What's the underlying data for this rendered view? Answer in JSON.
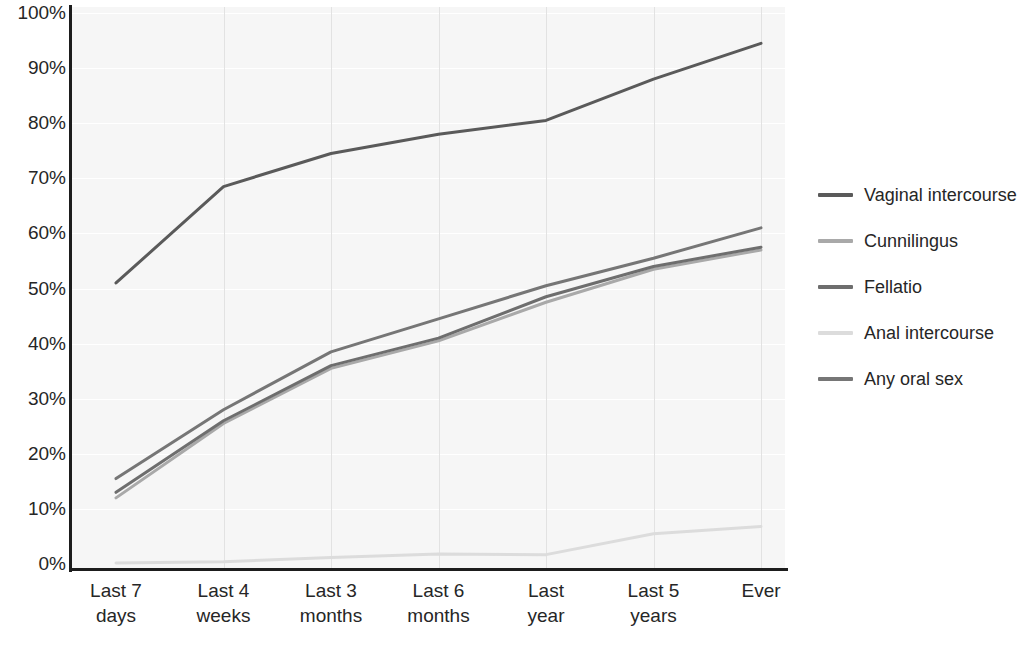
{
  "chart_data": {
    "type": "line",
    "title": "",
    "xlabel": "",
    "ylabel": "",
    "ylim": [
      0,
      100
    ],
    "ytick_labels": [
      "0%",
      "10%",
      "20%",
      "30%",
      "40%",
      "50%",
      "60%",
      "70%",
      "80%",
      "90%",
      "100%"
    ],
    "ytick_values": [
      0,
      10,
      20,
      30,
      40,
      50,
      60,
      70,
      80,
      90,
      100
    ],
    "grid": "horizontal-white-and-vertical-gray",
    "legend_position": "right",
    "categories": [
      "Last 7 days",
      "Last 4 weeks",
      "Last 3 months",
      "Last 6 months",
      "Last year",
      "Last 5 years",
      "Ever"
    ],
    "category_lines": [
      [
        "Last 7",
        "days"
      ],
      [
        "Last 4",
        "weeks"
      ],
      [
        "Last 3",
        "months"
      ],
      [
        "Last 6",
        "months"
      ],
      [
        "Last",
        "year"
      ],
      [
        "Last 5",
        "years"
      ],
      [
        "Ever",
        ""
      ]
    ],
    "series": [
      {
        "name": "Vaginal intercourse",
        "color": "#5a5a5a",
        "width": 3.0,
        "values": [
          51.0,
          68.5,
          74.5,
          78.0,
          80.5,
          88.0,
          94.5
        ]
      },
      {
        "name": "Cunnilingus",
        "color": "#a9a9a9",
        "width": 3.0,
        "values": [
          12.0,
          25.5,
          35.5,
          40.5,
          47.5,
          53.5,
          57.0
        ]
      },
      {
        "name": "Fellatio",
        "color": "#6e6e6e",
        "width": 3.0,
        "values": [
          13.0,
          26.0,
          36.0,
          41.0,
          48.5,
          54.0,
          57.5
        ]
      },
      {
        "name": "Anal intercourse",
        "color": "#dcdcdc",
        "width": 3.0,
        "values": [
          0.2,
          0.4,
          1.2,
          1.8,
          1.7,
          5.5,
          6.8
        ]
      },
      {
        "name": "Any oral sex",
        "color": "#767676",
        "width": 3.0,
        "values": [
          15.5,
          28.0,
          38.5,
          44.5,
          50.5,
          55.5,
          61.0
        ]
      }
    ]
  },
  "legend": {
    "items": [
      {
        "label": "Vaginal intercourse",
        "color": "#5a5a5a"
      },
      {
        "label": "Cunnilingus",
        "color": "#a9a9a9"
      },
      {
        "label": "Fellatio",
        "color": "#6e6e6e"
      },
      {
        "label": "Anal intercourse",
        "color": "#dcdcdc"
      },
      {
        "label": "Any oral sex",
        "color": "#767676"
      }
    ]
  },
  "colors": {
    "plot_background": "#f6f6f6",
    "axis": "#1d1d1d",
    "gridline_horizontal": "#ffffff",
    "gridline_vertical": "#e2e2e2",
    "text": "#262626",
    "page_background": "#ffffff"
  }
}
